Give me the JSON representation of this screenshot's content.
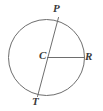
{
  "figure": {
    "kind": "circle-geometry-diagram",
    "width": 103,
    "height": 111,
    "background_color": "#ffffff",
    "stroke_color": "#6e6e6e",
    "label_color": "#3a3a3a",
    "stroke_width": 1,
    "circle": {
      "name": "main-circle",
      "center_x": 46.5,
      "center_y": 57.5,
      "radius": 38
    },
    "segments": [
      {
        "name": "diameter-PT",
        "from": "P",
        "to": "T",
        "x1": 58.5,
        "y1": 17.5,
        "x2": 37.5,
        "y2": 96.5
      },
      {
        "name": "radius-CR",
        "from": "C",
        "to": "R",
        "x1": 47.5,
        "y1": 57.5,
        "x2": 84.5,
        "y2": 57.5
      }
    ],
    "labels": [
      {
        "id": "P",
        "text": "P",
        "x": 58,
        "y": 9
      },
      {
        "id": "C",
        "text": "C",
        "x": 43,
        "y": 56
      },
      {
        "id": "R",
        "text": "R",
        "x": 89,
        "y": 57
      },
      {
        "id": "T",
        "text": "T",
        "x": 36,
        "y": 102
      }
    ]
  }
}
